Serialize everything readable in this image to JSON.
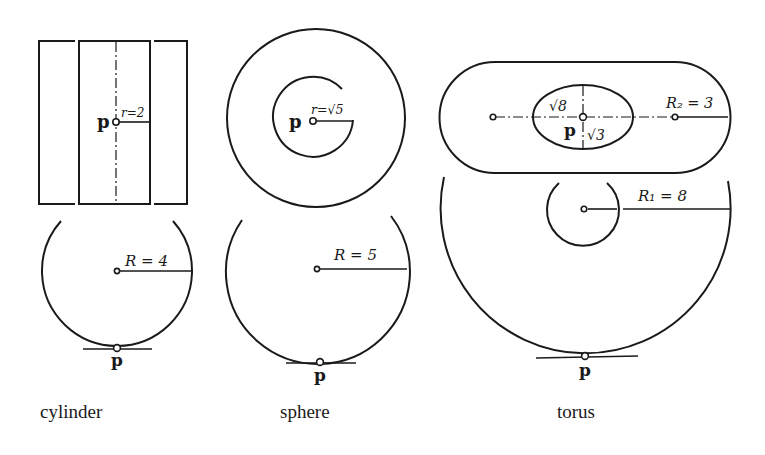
{
  "figure": {
    "captions": {
      "cylinder": "cylinder",
      "sphere": "sphere",
      "torus": "torus"
    },
    "point_label": "p",
    "cylinder": {
      "top_radius_label": "r=2",
      "side_radius_label": "R = 4"
    },
    "sphere": {
      "top_radius_label": "r=√5",
      "side_radius_label": "R = 5"
    },
    "torus": {
      "ellipse_major_label": "√8",
      "ellipse_minor_label": "√3",
      "tube_radius_label": "R₂ = 3",
      "main_radius_label": "R₁ = 8"
    }
  }
}
